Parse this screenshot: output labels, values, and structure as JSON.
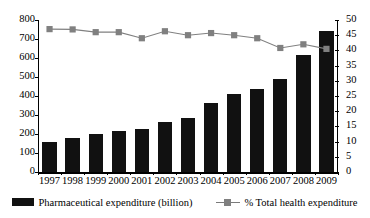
{
  "chart_data": {
    "type": "bar",
    "title": "",
    "xlabel": "",
    "ylabel": "",
    "grid": false,
    "legend_position": "bottom",
    "categories": [
      "1997",
      "1998",
      "1999",
      "2000",
      "2001",
      "2002",
      "2003",
      "2004",
      "2005",
      "2006",
      "2007",
      "2008",
      "2009"
    ],
    "axes": {
      "left": {
        "label": "Pharmaceutical expenditure (billion)",
        "ylim": [
          0,
          800
        ],
        "tick_step": 100,
        "ticks": [
          "0",
          "100",
          "200",
          "300",
          "400",
          "500",
          "600",
          "700",
          "800"
        ]
      },
      "right": {
        "label": "% Total health expenditure",
        "ylim": [
          0,
          50
        ],
        "tick_step": 5,
        "ticks": [
          "0",
          "5",
          "10",
          "15",
          "20",
          "25",
          "30",
          "35",
          "40",
          "45",
          "50"
        ]
      }
    },
    "series": [
      {
        "name": "Pharmaceutical expenditure (billion)",
        "type": "bar",
        "axis": "left",
        "color": "#111111",
        "values": [
          158,
          179,
          200,
          216,
          226,
          263,
          284,
          363,
          410,
          437,
          489,
          616,
          740
        ]
      },
      {
        "name": "% Total health expenditure",
        "type": "line",
        "axis": "right",
        "color": "#808080",
        "marker": "square",
        "values": [
          47.0,
          46.9,
          46.0,
          46.0,
          44.0,
          46.3,
          45.0,
          45.7,
          45.0,
          44.0,
          40.8,
          42.0,
          40.5
        ]
      }
    ]
  },
  "legend": {
    "items": [
      {
        "label": "Pharmaceutical expenditure (billion)",
        "marker": "bar-swatch",
        "color": "#111111"
      },
      {
        "label": "% Total health expenditure",
        "marker": "line-square",
        "color": "#808080"
      }
    ]
  }
}
